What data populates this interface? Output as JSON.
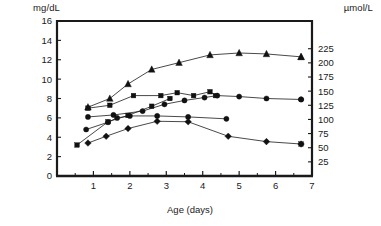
{
  "chart_data": {
    "type": "line",
    "title": "",
    "subtitle": "",
    "xlabel": "Age (days)",
    "ylabel": "mg/dL",
    "y2label": "µmol/L",
    "xlim": [
      0,
      7
    ],
    "ylim": [
      0,
      16
    ],
    "y2lim": [
      0,
      274
    ],
    "xticks": [
      1,
      2,
      3,
      4,
      5,
      6,
      7
    ],
    "xtick_labels": [
      "1",
      "2",
      "3",
      "4",
      "5",
      "6",
      "7"
    ],
    "x_minor_ticks": [
      0.5,
      1.5,
      2.5,
      3.5,
      4.5,
      5.5,
      6.5
    ],
    "yticks": [
      0,
      2,
      4,
      6,
      8,
      10,
      12,
      14,
      16
    ],
    "ytick_labels": [
      "0",
      "2",
      "4",
      "6",
      "8",
      "10",
      "12",
      "14",
      "16"
    ],
    "y2ticks": [
      25,
      50,
      75,
      100,
      125,
      150,
      175,
      200,
      225
    ],
    "y2tick_labels": [
      "25",
      "50",
      "75",
      "100",
      "125",
      "150",
      "175",
      "200",
      "225"
    ],
    "grid": false,
    "legend_position": "none",
    "series": [
      {
        "name": "series-triangle",
        "marker": "triangle",
        "x": [
          0.85,
          1.45,
          1.95,
          2.6,
          3.35,
          4.2,
          5.0,
          5.75,
          6.7
        ],
        "y": [
          7.1,
          8.0,
          9.5,
          11.0,
          11.7,
          12.5,
          12.7,
          12.6,
          12.3
        ]
      },
      {
        "name": "series-square-upper",
        "marker": "square",
        "x": [
          0.85,
          1.45,
          2.1,
          2.85,
          3.3,
          3.75,
          4.2,
          4.35
        ],
        "y": [
          7.0,
          7.3,
          8.3,
          8.3,
          8.6,
          8.3,
          8.7,
          8.3
        ]
      },
      {
        "name": "series-circle-flat",
        "marker": "circle",
        "x": [
          0.85,
          1.55,
          2.35,
          2.95,
          3.5,
          4.05,
          4.4,
          5.0,
          5.75,
          6.7
        ],
        "y": [
          6.1,
          6.3,
          6.7,
          7.4,
          7.8,
          8.1,
          8.3,
          8.2,
          8.0,
          7.9
        ]
      },
      {
        "name": "series-circle-mid",
        "marker": "circle",
        "x": [
          0.8,
          1.4,
          1.65,
          2.0,
          2.75,
          3.6,
          4.65
        ],
        "y": [
          4.8,
          5.55,
          6.0,
          6.2,
          6.2,
          6.1,
          5.9
        ]
      },
      {
        "name": "series-diamond-declining",
        "marker": "diamond",
        "x": [
          0.85,
          1.35,
          1.95,
          2.75,
          3.6,
          4.7,
          5.75,
          6.7
        ],
        "y": [
          3.4,
          4.1,
          4.9,
          5.65,
          5.6,
          4.1,
          3.55,
          3.3
        ]
      },
      {
        "name": "series-square-low-start",
        "marker": "square",
        "x": [
          0.55,
          1.4,
          1.95,
          2.6,
          3.1
        ],
        "y": [
          3.2,
          5.6,
          6.25,
          7.2,
          8.0
        ]
      }
    ],
    "endpoint_markers": [
      {
        "name": "triangle-endpoint",
        "x": 6.7,
        "y": 12.3,
        "marker": "triangle"
      },
      {
        "name": "circle-endpoint",
        "x": 6.7,
        "y": 7.9,
        "marker": "circle"
      },
      {
        "name": "square-endpoint",
        "x": 6.7,
        "y": 3.3,
        "marker": "square"
      }
    ]
  }
}
